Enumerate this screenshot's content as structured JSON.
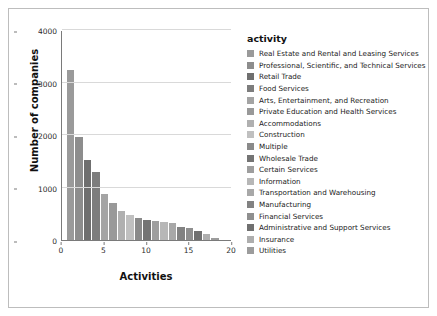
{
  "chart_data": {
    "type": "bar",
    "title": "",
    "xlabel": "Activities",
    "ylabel": "Number of companies",
    "xlim": [
      0,
      20
    ],
    "ylim": [
      0,
      4000
    ],
    "grid": true,
    "legend_position": "right",
    "legend_title": "activity",
    "xticks": [
      "0",
      "5",
      "10",
      "15",
      "20"
    ],
    "yticks": [
      "0",
      "1000",
      "2000",
      "3000",
      "4000"
    ],
    "categories": [
      1,
      2,
      3,
      4,
      5,
      6,
      7,
      8,
      9,
      10,
      11,
      12,
      13,
      14,
      15,
      16,
      17,
      18
    ],
    "values": [
      3230,
      1960,
      1520,
      1300,
      880,
      700,
      560,
      470,
      420,
      380,
      360,
      350,
      320,
      240,
      220,
      180,
      120,
      40
    ],
    "series": [
      {
        "name": "Real Estate and Rental and Leasing Services",
        "color": "#9a9a9a"
      },
      {
        "name": "Professional, Scientific, and Technical Services",
        "color": "#8d8d8d"
      },
      {
        "name": "Retail Trade",
        "color": "#6f6f6f"
      },
      {
        "name": "Food Services",
        "color": "#7d7d7d"
      },
      {
        "name": "Arts, Entertainment, and Recreation",
        "color": "#a4a4a4"
      },
      {
        "name": "Private Education and Health Services",
        "color": "#999999"
      },
      {
        "name": "Accommodations",
        "color": "#b0b0b0"
      },
      {
        "name": "Construction",
        "color": "#c0c0c0"
      },
      {
        "name": "Multiple",
        "color": "#8a8a8a"
      },
      {
        "name": "Wholesale Trade",
        "color": "#747474"
      },
      {
        "name": "Certain Services",
        "color": "#9e9e9e"
      },
      {
        "name": "Information",
        "color": "#b7b7b7"
      },
      {
        "name": "Transportation and Warehousing",
        "color": "#a8a8a8"
      },
      {
        "name": "Manufacturing",
        "color": "#828282"
      },
      {
        "name": "Financial Services",
        "color": "#8f8f8f"
      },
      {
        "name": "Administrative and Support Services",
        "color": "#707070"
      },
      {
        "name": "Insurance",
        "color": "#aeaeae"
      },
      {
        "name": "Utilities",
        "color": "#9c9c9c"
      }
    ]
  }
}
